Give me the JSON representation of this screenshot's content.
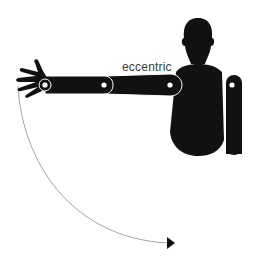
{
  "diagram": {
    "label": "eccentric",
    "figure": "human-silhouette-arm-extended",
    "motion": "arc-downward-arrow",
    "colors": {
      "silhouette": "#111111",
      "joint": "#ffffff",
      "arc": "#9a9a9a",
      "label": "#3a3a3a",
      "background": "#ffffff"
    }
  }
}
